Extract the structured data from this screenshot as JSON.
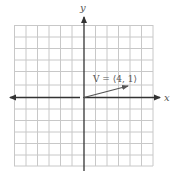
{
  "diagram": {
    "axes": {
      "x_label": "x",
      "y_label": "y"
    },
    "grid": {
      "x_min": -6,
      "x_max": 6,
      "y_min": -6,
      "y_max": 6,
      "step": 1
    },
    "vector": {
      "label": "V = ⟨4, 1⟩",
      "components": [
        4,
        1
      ],
      "origin": [
        0,
        0
      ]
    },
    "colors": {
      "grid": "#c8c8c8",
      "axis": "#333333",
      "vector": "#555555",
      "text": "#666666"
    }
  }
}
